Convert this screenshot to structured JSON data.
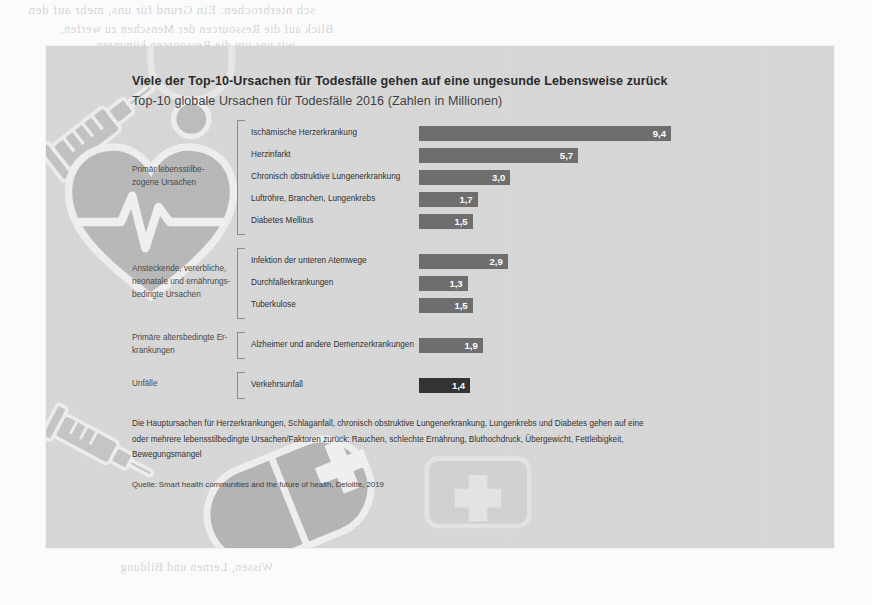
{
  "page": {
    "bleed_through_text": [
      "sch nterbrochen. Ein Grund für uns, mehr auf den",
      "Blick auf die Ressourcen der Menschen zu werfen.",
      "wir uns um die Ressourcen kümmern.",
      "Ebene der Arbeit",
      "Wissen, Lernen und Bildung"
    ]
  },
  "slide": {
    "title": "Viele der Top-10-Ursachen für Todesfälle gehen auf eine ungesunde Lebensweise zurück",
    "subtitle": "Top-10 globale Ursachen für Todesfälle 2016 (Zahlen in Millionen)",
    "footnote": "Die Hauptursachen für Herzerkrankungen, Schlaganfall, chronisch obstruktive Lungenerkrankung, Lungenkrebs und Diabetes gehen auf eine oder mehrere lebensstilbedingte Ursachen/Faktoren zurück: Rauchen, schlechte Ernährung, Bluthochdruck, Übergewicht, Fettleibigkeit, Bewegungsmangel",
    "source": "Quelle: Smart health communities and the future of health, Deloitte, 2019",
    "colors": {
      "slide_background": "#d9d9d9",
      "bar": "#6e6e6e",
      "bar_accent": "#333333",
      "title_text": "#2b2b2b",
      "value_text": "#ffffff"
    }
  },
  "chart_data": {
    "type": "bar",
    "title": "Viele der Top-10-Ursachen für Todesfälle gehen auf eine ungesunde Lebensweise zurück",
    "subtitle": "Top-10 globale Ursachen für Todesfälle 2016 (Zahlen in Millionen)",
    "xlabel": "Todesfälle (Millionen)",
    "ylabel": "",
    "xlim": [
      0,
      10
    ],
    "grid": false,
    "legend": "none",
    "orientation": "horizontal",
    "unit": "Millionen",
    "categories": [
      "Ischämische Herzerkrankung",
      "Herzinfarkt",
      "Chronisch obstruktive Lungenerkrankung",
      "Luftröhre, Branchen, Lungenkrebs",
      "Diabetes Mellitus",
      "Infektion der unteren Atemwege",
      "Durchfallerkrankungen",
      "Tuberkulose",
      "Alzheimer und andere Demenzerkrankungen",
      "Verkehrsunfall"
    ],
    "values": [
      9.4,
      5.7,
      3.0,
      1.7,
      1.5,
      2.9,
      1.3,
      1.5,
      1.9,
      1.4
    ],
    "groups": [
      {
        "label": "Primär lebensstilbe-\nzogene Ursachen",
        "label_lines": [
          "Primär lebensstilbe-",
          "zogene Ursachen"
        ],
        "rows": [
          {
            "label": "Ischämische Herzerkrankung",
            "value": 9.4,
            "display": "9,4",
            "accent": false
          },
          {
            "label": "Herzinfarkt",
            "value": 5.7,
            "display": "5,7",
            "accent": false
          },
          {
            "label": "Chronisch obstruktive Lungenerkrankung",
            "value": 3.0,
            "display": "3,0",
            "accent": false
          },
          {
            "label": "Luftröhre, Branchen, Lungenkrebs",
            "value": 1.7,
            "display": "1,7",
            "accent": false
          },
          {
            "label": "Diabetes Mellitus",
            "value": 1.5,
            "display": "1,5",
            "accent": false
          }
        ]
      },
      {
        "label": "Ansteckende, vererbliche, neonatale und ernährungs-bedingte Ursachen",
        "label_lines": [
          "Ansteckende, vererbliche,",
          "neonatale und ernährungs-",
          "bedingte Ursachen"
        ],
        "rows": [
          {
            "label": "Infektion der unteren Atemwege",
            "value": 2.9,
            "display": "2,9",
            "accent": false
          },
          {
            "label": "Durchfallerkrankungen",
            "value": 1.3,
            "display": "1,3",
            "accent": false
          },
          {
            "label": "Tuberkulose",
            "value": 1.5,
            "display": "1,5",
            "accent": false
          }
        ]
      },
      {
        "label": "Primäre altersbedingte Er-krankungen",
        "label_lines": [
          "Primäre altersbedingte Er-",
          "krankungen"
        ],
        "rows": [
          {
            "label": "Alzheimer und andere Demenzerkrankungen",
            "value": 1.9,
            "display": "1,9",
            "accent": false
          }
        ]
      },
      {
        "label": "Unfälle",
        "label_lines": [
          "Unfälle"
        ],
        "rows": [
          {
            "label": "Verkehrsunfall",
            "value": 1.4,
            "display": "1,4",
            "accent": true
          }
        ]
      }
    ]
  },
  "watermarks": [
    {
      "name": "syringe-icon"
    },
    {
      "name": "heart-pulse-icon"
    },
    {
      "name": "pill-capsule-icon"
    },
    {
      "name": "first-aid-cross-icon"
    },
    {
      "name": "stethoscope-icon"
    }
  ]
}
